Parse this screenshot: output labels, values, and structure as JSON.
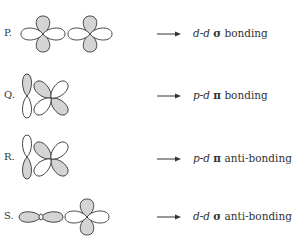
{
  "rows": [
    {
      "label": "P.",
      "orbital_a": "d",
      "orbital_b": "d",
      "symbol": "σ",
      "type": "bonding",
      "prefix": "d-d",
      "description": "d-d σ bonding"
    },
    {
      "label": "Q.",
      "orbital_a": "p",
      "orbital_b": "d",
      "symbol": "π",
      "type": "bonding",
      "prefix": "p-d",
      "description": "p-d π bonding"
    },
    {
      "label": "R.",
      "orbital_a": "p",
      "orbital_b": "d",
      "symbol": "π",
      "type": "anti-bonding",
      "prefix": "p-d",
      "description": "p-d π anti-bonding"
    },
    {
      "label": "S.",
      "orbital_a": "d",
      "orbital_b": "d",
      "symbol": "σ",
      "type": "anti-bonding",
      "prefix": "d-d",
      "description": "d-d σ anti-bonding"
    }
  ],
  "colors": {
    "lobe_fill": "#d4d4d4",
    "lobe_stroke": "#333333",
    "background": "#ffffff"
  },
  "arrow_icon": "right-arrow-icon"
}
